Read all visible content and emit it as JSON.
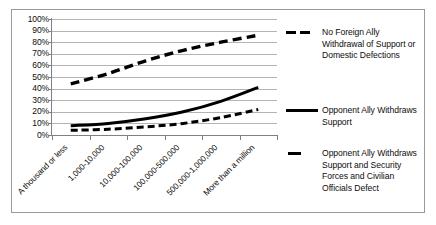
{
  "chart_data": {
    "type": "line",
    "title": "",
    "xlabel": "",
    "ylabel": "",
    "ylim": [
      0,
      100
    ],
    "grid": true,
    "legend_position": "right",
    "categories": [
      "A thousand or less",
      "1,000-10,000",
      "10,000-100,000",
      "100,000-500,000",
      "500,000-1,000,000",
      "More than a million"
    ],
    "ytick_labels": [
      "100%",
      "90%",
      "80%",
      "70%",
      "60%",
      "50%",
      "40%",
      "30%",
      "20%",
      "10%",
      "0%"
    ],
    "ytick_values": [
      100,
      90,
      80,
      70,
      60,
      50,
      40,
      30,
      20,
      10,
      0
    ],
    "series": [
      {
        "name": "No Foreign Ally Withdrawal of Support or Domestic Defections",
        "style": "dashed-thick",
        "color": "#000000",
        "values": [
          44,
          53,
          64,
          73,
          80,
          86
        ]
      },
      {
        "name": "Opponent Ally Withdraws Support",
        "style": "solid-thick",
        "color": "#000000",
        "values": [
          8,
          10,
          14,
          20,
          29,
          41
        ]
      },
      {
        "name": "Opponent Ally Withdraws Support and Security Forces and Civilian Officials Defect",
        "style": "dashed-medium",
        "color": "#000000",
        "values": [
          4,
          5,
          7,
          10,
          15,
          22
        ]
      }
    ]
  },
  "legend": {
    "entries": [
      {
        "lines": [
          "No Foreign Ally",
          "Withdrawal of Support or",
          "Domestic Defections"
        ],
        "marker": "dashed-line-marker"
      },
      {
        "lines": [
          "Opponent Ally Withdraws",
          "Support"
        ],
        "marker": "solid-line-marker"
      },
      {
        "lines": [
          "Opponent Ally Withdraws",
          "Support and Security",
          "Forces and Civilian",
          "Officials Defect"
        ],
        "marker": "short-dash-line-marker"
      }
    ]
  }
}
